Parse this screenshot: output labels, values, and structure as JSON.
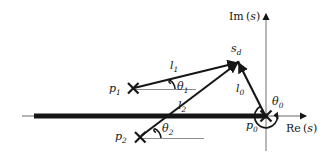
{
  "figure": {
    "type": "pole-zero-angle-diagram",
    "background_color": "#ffffff",
    "ink_color": "#161616",
    "axis_color": "#9a9a9a"
  },
  "axes": {
    "imaginary": {
      "label_prefix": "Im",
      "label_open": "(",
      "label_var": "s",
      "label_close": ")",
      "label_full": "Im (s)",
      "x": 266,
      "y_top": 12,
      "y_bottom": 151
    },
    "real": {
      "label_prefix": "Re",
      "label_open": "(",
      "label_var": "s",
      "label_close": ")",
      "label_full": "Re (s)",
      "y": 116,
      "x_left": 22,
      "x_right": 308
    },
    "locus_segment": {
      "name": "real-axis-locus",
      "x_start": 34,
      "x_end": 266,
      "y": 116,
      "thickness": 5
    }
  },
  "points": [
    {
      "id": "p0",
      "label": "p",
      "subscript": "0",
      "marker": "cross",
      "x": 266,
      "y": 116,
      "label_x": 246,
      "label_y": 120
    },
    {
      "id": "p1",
      "label": "p",
      "subscript": "1",
      "marker": "cross",
      "x": 133,
      "y": 88,
      "label_x": 109,
      "label_y": 84
    },
    {
      "id": "p2",
      "label": "p",
      "subscript": "2",
      "marker": "cross",
      "x": 140,
      "y": 137,
      "label_x": 115,
      "label_y": 132
    },
    {
      "id": "sd",
      "label": "s",
      "subscript": "d",
      "marker": "arrow-convergence",
      "x": 238,
      "y": 62,
      "label_x": 231,
      "label_y": 44
    }
  ],
  "vectors": [
    {
      "id": "l0",
      "label": "l",
      "subscript": "0",
      "from": "p0",
      "to": "sd",
      "label_x": 236,
      "label_y": 84
    },
    {
      "id": "l1",
      "label": "l",
      "subscript": "1",
      "from": "p1",
      "to": "sd",
      "label_x": 170,
      "label_y": 61
    },
    {
      "id": "l2",
      "label": "l",
      "subscript": "2",
      "from": "p2",
      "to": "sd",
      "label_x": 178,
      "label_y": 101
    }
  ],
  "angles": [
    {
      "id": "theta0",
      "label": "θ",
      "subscript": "0",
      "at": "p0",
      "label_x": 272,
      "label_y": 98
    },
    {
      "id": "theta1",
      "label": "θ",
      "subscript": "1",
      "at": "p1",
      "label_x": 177,
      "label_y": 82
    },
    {
      "id": "theta2",
      "label": "θ",
      "subscript": "2",
      "at": "p2",
      "label_x": 162,
      "label_y": 124
    }
  ],
  "reference_lines": [
    {
      "id": "ref-p1",
      "x1": 133,
      "y1": 89,
      "x2": 196,
      "y2": 89
    },
    {
      "id": "ref-p2",
      "x1": 140,
      "y1": 138,
      "x2": 203,
      "y2": 138
    }
  ]
}
